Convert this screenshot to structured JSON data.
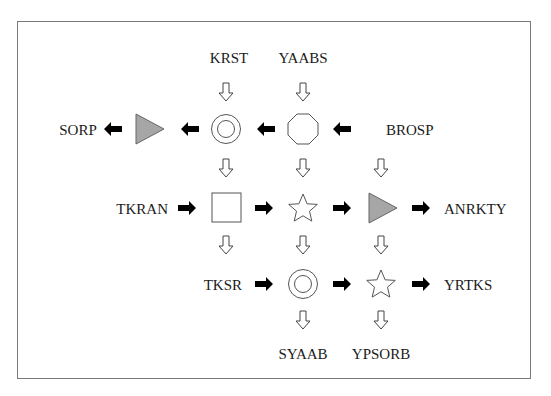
{
  "diagram": {
    "labels": {
      "krst": "KRST",
      "yaabs": "YAABS",
      "sorp": "SORP",
      "brosp": "BROSP",
      "tkran": "TKRAN",
      "anrkty": "ANRKTY",
      "tksr": "TKSR",
      "yrtks": "YRTKS",
      "syaab": "SYAAB",
      "ypsorb": "YPSORB"
    },
    "nodes": [
      {
        "id": "r1c1",
        "shape": "double-circle",
        "row": 1,
        "col": 1
      },
      {
        "id": "r1c2",
        "shape": "octagon",
        "row": 1,
        "col": 2
      },
      {
        "id": "r1c0",
        "shape": "gray-triangle",
        "row": 1,
        "col": 0
      },
      {
        "id": "r2c1",
        "shape": "square",
        "row": 2,
        "col": 1
      },
      {
        "id": "r2c2",
        "shape": "star",
        "row": 2,
        "col": 2
      },
      {
        "id": "r2c3",
        "shape": "gray-triangle",
        "row": 2,
        "col": 3
      },
      {
        "id": "r3c2",
        "shape": "double-circle",
        "row": 3,
        "col": 2
      },
      {
        "id": "r3c3",
        "shape": "star",
        "row": 3,
        "col": 3
      }
    ],
    "colors": {
      "border": "#7a7a7a",
      "shape_stroke": "#555555",
      "triangle_fill": "#a6a6a6",
      "solid_arrow": "#000000",
      "hollow_arrow_stroke": "#444444"
    }
  }
}
